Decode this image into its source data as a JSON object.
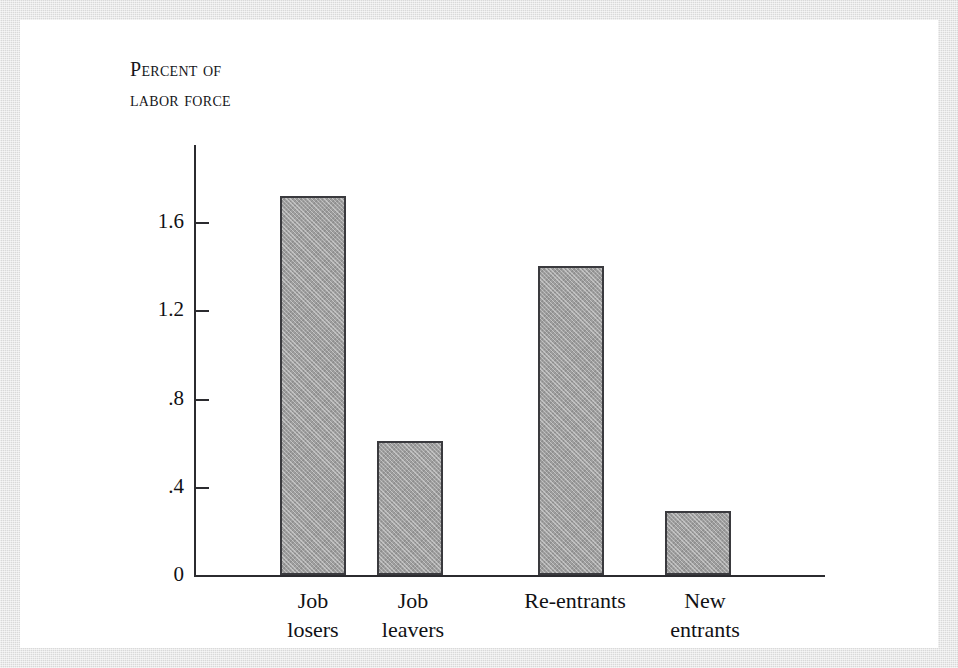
{
  "figure": {
    "background_color": "#d9d9d9",
    "plot_background_color": "#ffffff",
    "bar_fill_color": "#9e9e9e",
    "bar_border_color": "#3a3a3e",
    "axis_color": "#2b2b2f"
  },
  "axis_title": "Percent of\nlabor force",
  "chart_data": {
    "type": "bar",
    "title": "",
    "subtitle": "",
    "xlabel": "",
    "ylabel": "Percent of labor force",
    "categories": [
      "Job losers",
      "Job leavers",
      "Re-entrants",
      "New entrants"
    ],
    "category_labels_wrapped": [
      "Job\nlosers",
      "Job\nleavers",
      "Re-entrants",
      "New\nentrants"
    ],
    "values": [
      1.72,
      0.61,
      1.4,
      0.29
    ],
    "ylim": [
      0,
      1.95
    ],
    "yticks": [
      0,
      0.4,
      0.8,
      1.2,
      1.6
    ],
    "ytick_labels": [
      "0",
      ".4",
      ".8",
      "1.2",
      "1.6"
    ],
    "grid": false,
    "legend": null,
    "annotations": []
  }
}
